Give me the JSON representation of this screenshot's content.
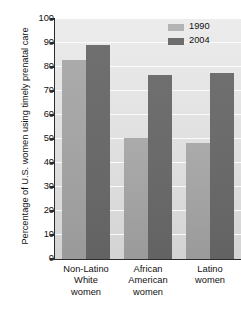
{
  "chart_data": {
    "type": "bar",
    "title": "",
    "xlabel": "",
    "ylabel": "Percentage of U.S. women using timely prenatal care",
    "categories": [
      "Non-Latino White women",
      "African American women",
      "Latino women"
    ],
    "category_lines": [
      [
        "Non-Latino",
        "White",
        "women"
      ],
      [
        "African",
        "American",
        "women"
      ],
      [
        "Latino",
        "women"
      ]
    ],
    "series": [
      {
        "name": "1990",
        "color": "#a8a8a8",
        "values": [
          83,
          50.5,
          48.5
        ]
      },
      {
        "name": "2004",
        "color": "#6c6c6c",
        "values": [
          89,
          76.5,
          77.5
        ]
      }
    ],
    "ylim": [
      0,
      100
    ],
    "ytick_labels": [
      "0",
      "10",
      "20",
      "30",
      "40",
      "50",
      "60",
      "70",
      "80",
      "90",
      "100"
    ],
    "ytick_values": [
      0,
      10,
      20,
      30,
      40,
      50,
      60,
      70,
      80,
      90,
      100
    ],
    "grid": true,
    "grid_color": "#fbfbfb",
    "legend_position": "top-right",
    "plot_background": "#e3e3e3"
  },
  "legend": {
    "items": [
      {
        "label": "1990"
      },
      {
        "label": "2004"
      }
    ]
  }
}
